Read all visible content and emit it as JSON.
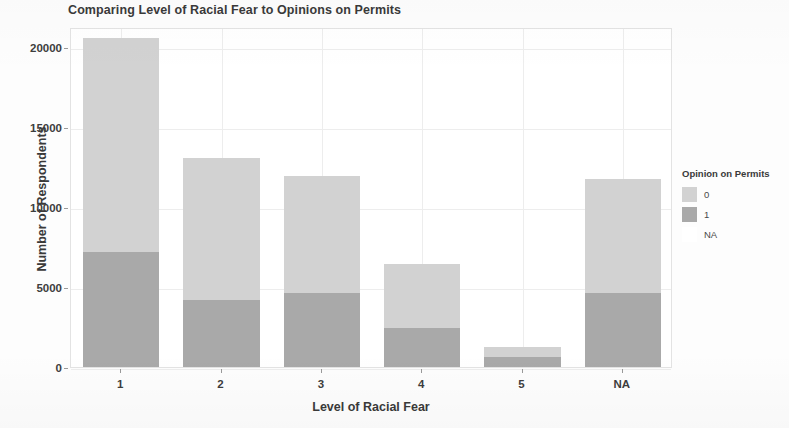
{
  "chart_data": {
    "type": "bar",
    "subtype": "stacked-bar",
    "title": "Comparing Level of Racial Fear to Opinions on Permits",
    "xlabel": "Level of Racial Fear",
    "ylabel": "Number of Respondents",
    "categories": [
      "1",
      "2",
      "3",
      "4",
      "5",
      "NA"
    ],
    "series": [
      {
        "name": "1",
        "color": "#a9a9a9",
        "values": [
          7200,
          4200,
          4650,
          2450,
          625,
          4650
        ]
      },
      {
        "name": "0",
        "color": "#d2d2d2",
        "values": [
          13350,
          8850,
          7300,
          4000,
          625,
          7100
        ]
      }
    ],
    "totals": [
      20550,
      13050,
      11950,
      6450,
      1250,
      11750
    ],
    "ylim": [
      0,
      21250
    ],
    "y_ticks": [
      0,
      5000,
      10000,
      15000,
      20000
    ],
    "y_tick_labels": [
      "0",
      "5000",
      "10000",
      "15000",
      "20000"
    ],
    "x_tick_labels": [
      "1",
      "2",
      "3",
      "4",
      "5",
      "NA"
    ],
    "grid": true,
    "legend_position": "right"
  },
  "legend": {
    "title": "Opinion on Permits",
    "items": [
      {
        "label": "0",
        "color": "#d2d2d2"
      },
      {
        "label": "1",
        "color": "#a9a9a9"
      },
      {
        "label": "NA",
        "color": "#ffffff"
      }
    ]
  }
}
